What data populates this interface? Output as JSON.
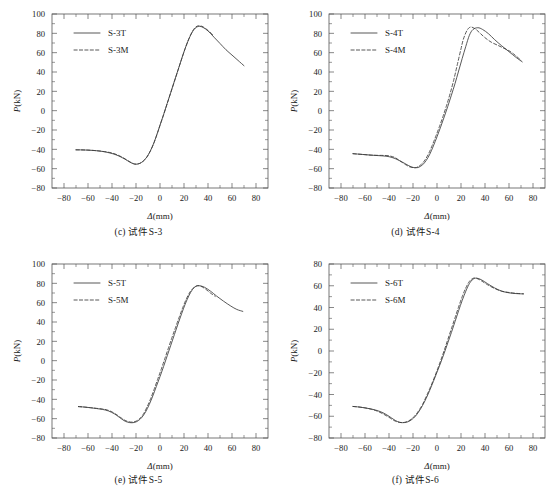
{
  "figure": {
    "panel_count": 4,
    "axis": {
      "xlabel_symbol": "Δ",
      "xlabel_unit": "(mm)",
      "ylabel_symbol": "P",
      "ylabel_unit": "(kN)",
      "x_ticks": [
        -80,
        -60,
        -40,
        -20,
        0,
        20,
        40,
        60,
        80
      ],
      "x_tick_labels": [
        "−80",
        "−60",
        "−40",
        "−20",
        "0",
        "20",
        "40",
        "60",
        "80"
      ],
      "y_ticks_180": [
        -80,
        -60,
        -40,
        -20,
        0,
        20,
        40,
        60,
        80,
        100
      ],
      "y_tick_labels_180": [
        "−80",
        "−60",
        "−40",
        "−20",
        "0",
        "20",
        "40",
        "60",
        "80",
        "100"
      ],
      "y_ticks_160": [
        -80,
        -60,
        -40,
        -20,
        0,
        20,
        40,
        60,
        80
      ],
      "y_tick_labels_160": [
        "−80",
        "−60",
        "−40",
        "−20",
        "0",
        "20",
        "40",
        "60",
        "80"
      ]
    },
    "line_color": "#3a3a3a",
    "frame_color": "#555555"
  },
  "chart_data": [
    {
      "type": "line",
      "panel_id": "c",
      "caption": "(c) 试件S-3",
      "title": "",
      "xlabel": "Δ(mm)",
      "ylabel": "P(kN)",
      "xlim": [
        -90,
        90
      ],
      "ylim": [
        -80,
        100
      ],
      "xticks": [
        -80,
        -60,
        -40,
        -20,
        0,
        20,
        40,
        60,
        80
      ],
      "yticks": [
        -80,
        -60,
        -40,
        -20,
        0,
        20,
        40,
        60,
        80,
        100
      ],
      "grid": false,
      "legend_position": "upper-left",
      "series": [
        {
          "name": "S-3T",
          "style": "solid",
          "x": [
            -70,
            -65,
            -60,
            -55,
            -50,
            -45,
            -40,
            -35,
            -30,
            -25,
            -22,
            -20,
            -17,
            -14,
            -11,
            -8,
            -5,
            -2,
            0,
            3,
            6,
            9,
            12,
            15,
            18,
            21,
            24,
            27,
            30,
            33,
            36,
            40,
            45,
            50,
            55,
            60,
            65,
            70
          ],
          "y": [
            -40.5,
            -40.6,
            -40.8,
            -41.2,
            -41.8,
            -42.8,
            -44.3,
            -46.5,
            -49.6,
            -53.3,
            -55.0,
            -55.4,
            -54.6,
            -52.2,
            -48.0,
            -41.5,
            -33.0,
            -22.5,
            -15.0,
            -4.0,
            7.5,
            19.0,
            30.5,
            42.0,
            53.5,
            64.5,
            74.0,
            81.5,
            86.0,
            87.2,
            86.0,
            82.5,
            76.0,
            69.5,
            63.0,
            57.5,
            52.0,
            46.5
          ]
        },
        {
          "name": "S-3M",
          "style": "dashed",
          "x": [
            -70,
            -65,
            -60,
            -55,
            -50,
            -45,
            -40,
            -35,
            -30,
            -25,
            -22,
            -20,
            -17,
            -14,
            -11,
            -8,
            -5,
            -2,
            0,
            3,
            6,
            9,
            12,
            15,
            18,
            21,
            24,
            27,
            30,
            33,
            36,
            40,
            44
          ],
          "y": [
            -40.5,
            -40.6,
            -40.8,
            -41.2,
            -41.8,
            -42.6,
            -43.8,
            -46.0,
            -49.2,
            -53.0,
            -54.8,
            -55.3,
            -54.6,
            -52.3,
            -48.2,
            -41.7,
            -33.2,
            -22.7,
            -15.2,
            -4.2,
            7.3,
            18.8,
            30.3,
            41.8,
            53.3,
            64.3,
            74.2,
            82.0,
            86.8,
            87.8,
            86.6,
            83.0,
            78.5
          ]
        }
      ]
    },
    {
      "type": "line",
      "panel_id": "d",
      "caption": "(d) 试件S-4",
      "title": "",
      "xlabel": "Δ(mm)",
      "ylabel": "P(kN)",
      "xlim": [
        -90,
        90
      ],
      "ylim": [
        -80,
        100
      ],
      "xticks": [
        -80,
        -60,
        -40,
        -20,
        0,
        20,
        40,
        60,
        80
      ],
      "yticks": [
        -80,
        -60,
        -40,
        -20,
        0,
        20,
        40,
        60,
        80,
        100
      ],
      "grid": false,
      "legend_position": "upper-left",
      "series": [
        {
          "name": "S-4T",
          "style": "solid",
          "x": [
            -70,
            -65,
            -60,
            -55,
            -50,
            -45,
            -40,
            -35,
            -30,
            -27,
            -24,
            -21,
            -19,
            -17,
            -15,
            -12,
            -9,
            -6,
            -3,
            0,
            3,
            6,
            9,
            12,
            15,
            18,
            21,
            24,
            27,
            30,
            34,
            38,
            43,
            48,
            54,
            60,
            66,
            71
          ],
          "y": [
            -44.5,
            -45.0,
            -45.5,
            -46.0,
            -46.4,
            -46.8,
            -47.6,
            -49.5,
            -52.5,
            -54.5,
            -56.6,
            -58.3,
            -58.9,
            -59.0,
            -58.4,
            -56.0,
            -51.5,
            -45.0,
            -36.5,
            -27.0,
            -17.0,
            -6.5,
            4.5,
            16.0,
            28.0,
            41.0,
            54.0,
            66.5,
            78.0,
            84.0,
            85.8,
            84.0,
            79.5,
            73.5,
            67.0,
            61.0,
            55.0,
            50.5
          ]
        },
        {
          "name": "S-4M",
          "style": "dashed",
          "x": [
            -70,
            -65,
            -60,
            -55,
            -50,
            -45,
            -40,
            -35,
            -32,
            -29,
            -26,
            -23,
            -20,
            -18,
            -16,
            -13,
            -10,
            -7,
            -4,
            -1,
            2,
            5,
            8,
            11,
            14,
            17,
            20,
            22,
            25,
            28,
            32,
            36,
            40,
            45,
            50,
            55,
            60,
            65,
            70
          ],
          "y": [
            -44.5,
            -45.0,
            -45.5,
            -46.0,
            -46.2,
            -46.3,
            -46.7,
            -48.5,
            -51.0,
            -53.5,
            -56.0,
            -58.0,
            -58.9,
            -59.0,
            -58.2,
            -55.5,
            -51.0,
            -44.5,
            -36.0,
            -26.5,
            -16.5,
            -6.0,
            5.5,
            18.0,
            32.0,
            48.0,
            64.0,
            74.0,
            83.0,
            86.5,
            84.5,
            80.0,
            75.5,
            71.0,
            68.0,
            65.0,
            62.0,
            57.5,
            52.0
          ]
        }
      ]
    },
    {
      "type": "line",
      "panel_id": "e",
      "caption": "(e) 试件S-5",
      "title": "",
      "xlabel": "Δ(mm)",
      "ylabel": "P(kN)",
      "xlim": [
        -90,
        90
      ],
      "ylim": [
        -80,
        100
      ],
      "xticks": [
        -80,
        -60,
        -40,
        -20,
        0,
        20,
        40,
        60,
        80
      ],
      "yticks": [
        -80,
        -60,
        -40,
        -20,
        0,
        20,
        40,
        60,
        80,
        100
      ],
      "grid": false,
      "legend_position": "upper-left",
      "series": [
        {
          "name": "S-5T",
          "style": "solid",
          "x": [
            -68,
            -63,
            -58,
            -53,
            -48,
            -43,
            -38,
            -34,
            -30,
            -27,
            -24,
            -21,
            -18,
            -15,
            -12,
            -9,
            -6,
            -3,
            0,
            3,
            6,
            9,
            12,
            15,
            18,
            21,
            24,
            27,
            30,
            33,
            37,
            42,
            47,
            53,
            59,
            64,
            69
          ],
          "y": [
            -47.5,
            -48.0,
            -48.7,
            -49.5,
            -50.4,
            -52.0,
            -55.0,
            -58.5,
            -62.0,
            -63.6,
            -64.2,
            -63.8,
            -62.0,
            -58.5,
            -53.0,
            -45.5,
            -36.5,
            -26.5,
            -16.5,
            -6.0,
            5.0,
            16.0,
            27.0,
            38.0,
            48.5,
            58.5,
            67.0,
            73.5,
            77.0,
            77.5,
            76.0,
            72.0,
            67.0,
            61.5,
            56.5,
            53.0,
            51.0
          ]
        },
        {
          "name": "S-5M",
          "style": "dashed",
          "x": [
            -68,
            -63,
            -58,
            -53,
            -48,
            -44,
            -40,
            -36,
            -32,
            -29,
            -26,
            -23,
            -20,
            -17,
            -14,
            -11,
            -8,
            -5,
            -2,
            1,
            4,
            7,
            10,
            13,
            16,
            19,
            22,
            25,
            28,
            31,
            34,
            38,
            42,
            46
          ],
          "y": [
            -47.5,
            -48.0,
            -48.6,
            -49.3,
            -50.0,
            -51.0,
            -53.0,
            -56.0,
            -59.5,
            -61.8,
            -63.2,
            -63.6,
            -62.6,
            -60.0,
            -55.5,
            -48.5,
            -40.0,
            -30.0,
            -19.5,
            -9.0,
            2.0,
            13.0,
            24.0,
            34.5,
            45.0,
            55.0,
            64.0,
            71.0,
            75.5,
            77.5,
            77.0,
            74.0,
            70.0,
            66.5
          ]
        }
      ]
    },
    {
      "type": "line",
      "panel_id": "f",
      "caption": "(f) 试件S-6",
      "title": "",
      "xlabel": "Δ(mm)",
      "ylabel": "P(kN)",
      "xlim": [
        -90,
        90
      ],
      "ylim": [
        -80,
        80
      ],
      "xticks": [
        -80,
        -60,
        -40,
        -20,
        0,
        20,
        40,
        60,
        80
      ],
      "yticks": [
        -80,
        -60,
        -40,
        -20,
        0,
        20,
        40,
        60,
        80
      ],
      "grid": false,
      "legend_position": "upper-left",
      "series": [
        {
          "name": "S-6T",
          "style": "solid",
          "x": [
            -70,
            -65,
            -60,
            -55,
            -50,
            -45,
            -40,
            -36,
            -33,
            -30,
            -27,
            -24,
            -21,
            -18,
            -15,
            -12,
            -9,
            -6,
            -3,
            0,
            3,
            6,
            9,
            12,
            15,
            18,
            21,
            24,
            27,
            30,
            33,
            37,
            42,
            48,
            54,
            60,
            66,
            72
          ],
          "y": [
            -51.0,
            -51.5,
            -52.3,
            -53.3,
            -54.7,
            -56.8,
            -60.0,
            -63.0,
            -64.8,
            -65.8,
            -65.8,
            -65.0,
            -63.0,
            -60.0,
            -55.5,
            -50.0,
            -43.5,
            -36.0,
            -28.0,
            -19.5,
            -11.0,
            -2.0,
            7.5,
            17.0,
            27.0,
            37.0,
            46.5,
            55.0,
            62.0,
            66.0,
            67.0,
            65.5,
            62.0,
            58.0,
            55.0,
            53.5,
            52.8,
            52.5
          ]
        },
        {
          "name": "S-6M",
          "style": "dashed",
          "x": [
            -70,
            -65,
            -60,
            -55,
            -50,
            -45,
            -40,
            -36,
            -33,
            -30,
            -27,
            -24,
            -21,
            -18,
            -15,
            -12,
            -9,
            -6,
            -3,
            0,
            3,
            6,
            9,
            12,
            15,
            18,
            21,
            24,
            27,
            30,
            33,
            37,
            42,
            48,
            54,
            60,
            66,
            72
          ],
          "y": [
            -51.0,
            -51.5,
            -52.3,
            -53.5,
            -55.2,
            -57.8,
            -61.0,
            -63.8,
            -65.2,
            -65.8,
            -65.6,
            -64.5,
            -62.3,
            -59.0,
            -54.5,
            -49.0,
            -42.0,
            -34.5,
            -26.5,
            -18.0,
            -9.0,
            0.5,
            10.5,
            20.5,
            30.5,
            40.5,
            50.0,
            58.0,
            64.0,
            66.8,
            66.8,
            64.5,
            61.0,
            57.5,
            55.0,
            53.8,
            53.0,
            52.6
          ]
        }
      ]
    }
  ]
}
